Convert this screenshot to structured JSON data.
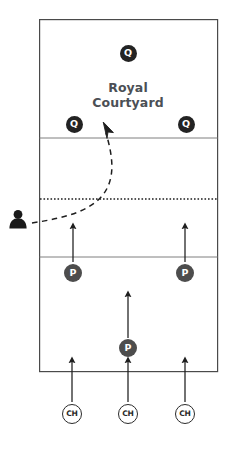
{
  "diagram": {
    "background_color": "#ffffff",
    "field": {
      "name": "field-outline",
      "x": 39,
      "y": 19,
      "width": 179,
      "height": 353,
      "stroke_color": "#4a4a4a",
      "fill_color": "#ffffff",
      "stroke_width": 1.2
    },
    "lines": [
      {
        "name": "division-line-upper",
        "y": 138,
        "style": "solid",
        "color": "#7a7a7a"
      },
      {
        "name": "division-line-lower",
        "y": 257,
        "style": "solid",
        "color": "#7a7a7a"
      },
      {
        "name": "midfield-line-dotted",
        "y": 199,
        "style": "dotted",
        "color": "#1e1e1e"
      }
    ],
    "zone_label": {
      "name": "royal-courtyard-label",
      "line1": "Royal",
      "line2": "Courtyard",
      "color": "#4b4f55",
      "x": 128,
      "y": 88
    },
    "units": [
      {
        "name": "unit-q-top-center",
        "label": "Q",
        "type": "queen",
        "x": 128,
        "y": 53,
        "color": "#232323",
        "text_color": "#ffffff"
      },
      {
        "name": "unit-q-left",
        "label": "Q",
        "type": "queen",
        "x": 74,
        "y": 124,
        "color": "#232323",
        "text_color": "#ffffff"
      },
      {
        "name": "unit-q-right",
        "label": "Q",
        "type": "queen",
        "x": 186,
        "y": 124,
        "color": "#232323",
        "text_color": "#ffffff"
      },
      {
        "name": "unit-p-left",
        "label": "P",
        "type": "pawn",
        "x": 73,
        "y": 273,
        "color": "#4d4d4d",
        "text_color": "#ffffff"
      },
      {
        "name": "unit-p-right",
        "label": "P",
        "type": "pawn",
        "x": 185,
        "y": 273,
        "color": "#4d4d4d",
        "text_color": "#ffffff"
      },
      {
        "name": "unit-p-center",
        "label": "P",
        "type": "pawn",
        "x": 128,
        "y": 348,
        "color": "#4d4d4d",
        "text_color": "#ffffff"
      },
      {
        "name": "unit-ch-left",
        "label": "CH",
        "type": "charger",
        "x": 72,
        "y": 414,
        "color": "#ffffff",
        "text_color": "#2b2b2b"
      },
      {
        "name": "unit-ch-center",
        "label": "CH",
        "type": "charger",
        "x": 128,
        "y": 414,
        "color": "#ffffff",
        "text_color": "#2b2b2b"
      },
      {
        "name": "unit-ch-right",
        "label": "CH",
        "type": "charger",
        "x": 185,
        "y": 414,
        "color": "#2b2b2b",
        "text_color": "#2b2b2b"
      }
    ],
    "movement_arrows": [
      {
        "name": "arrow-p-left-advance",
        "x1": 73,
        "y1": 262,
        "x2": 73,
        "y2": 224
      },
      {
        "name": "arrow-p-right-advance",
        "x1": 185,
        "y1": 262,
        "x2": 185,
        "y2": 224
      },
      {
        "name": "arrow-p-center-advance",
        "x1": 128,
        "y1": 338,
        "x2": 128,
        "y2": 292
      },
      {
        "name": "arrow-ch-left-advance",
        "x1": 72,
        "y1": 402,
        "x2": 72,
        "y2": 358
      },
      {
        "name": "arrow-ch-center-advance",
        "x1": 128,
        "y1": 402,
        "x2": 128,
        "y2": 358
      },
      {
        "name": "arrow-ch-right-advance",
        "x1": 185,
        "y1": 402,
        "x2": 185,
        "y2": 358
      }
    ],
    "dashed_path": {
      "name": "viewer-sight-path",
      "style": "dashed",
      "color": "#1e1e1e",
      "description": "curved dashed path from observer to courtyard"
    },
    "pointer": {
      "name": "cursor-pointer",
      "x": 105,
      "y": 124,
      "color": "#1e1e1e"
    },
    "observer": {
      "name": "observer-person-icon",
      "x": 18,
      "y": 219,
      "color": "#1a1a1a"
    }
  }
}
